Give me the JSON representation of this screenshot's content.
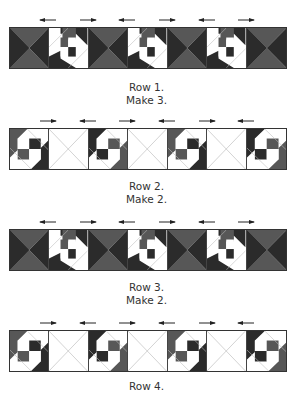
{
  "colors": {
    "dark": "#2b2b2b",
    "medium": "#575757",
    "light": "#ffffff",
    "line": "#bdbdbd"
  },
  "rows": [
    {
      "caption_line1": "Row 1.",
      "caption_line2": "Make 3.",
      "blocks": [
        "hourglass",
        "pinwheel-a",
        "hourglass",
        "pinwheel-a",
        "hourglass",
        "pinwheel-a",
        "hourglass"
      ],
      "arrows": [
        "left",
        "right",
        "left",
        "right",
        "left",
        "right"
      ]
    },
    {
      "caption_line1": "Row 2.",
      "caption_line2": "Make 2.",
      "blocks": [
        "pinwheel-b",
        "plain-x",
        "pinwheel-b",
        "plain-x",
        "pinwheel-b",
        "plain-x",
        "pinwheel-b"
      ],
      "arrows": [
        "right",
        "left",
        "right",
        "left",
        "right",
        "left"
      ]
    },
    {
      "caption_line1": "Row 3.",
      "caption_line2": "Make 2.",
      "blocks": [
        "hourglass",
        "pinwheel-a",
        "hourglass",
        "pinwheel-a",
        "hourglass",
        "pinwheel-a",
        "hourglass"
      ],
      "arrows": [
        "left",
        "right",
        "left",
        "right",
        "left",
        "right"
      ]
    },
    {
      "caption_line1": "Row 4.",
      "caption_line2": "",
      "blocks": [
        "pinwheel-b",
        "plain-x",
        "pinwheel-b",
        "plain-x",
        "pinwheel-b",
        "plain-x",
        "pinwheel-b"
      ],
      "arrows": [
        "right",
        "left",
        "right",
        "left",
        "right",
        "left"
      ]
    }
  ]
}
